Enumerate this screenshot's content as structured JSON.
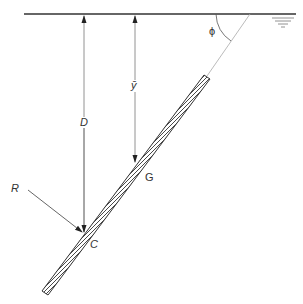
{
  "diagram": {
    "labels": {
      "depth_centroid": "ȳ",
      "depth_pressure": "D",
      "angle": "ϕ",
      "resultant": "R",
      "centroid": "G",
      "center_of_pressure": "C"
    },
    "colors": {
      "line": "#333333",
      "thin_line": "#888888",
      "background": "#ffffff"
    }
  }
}
